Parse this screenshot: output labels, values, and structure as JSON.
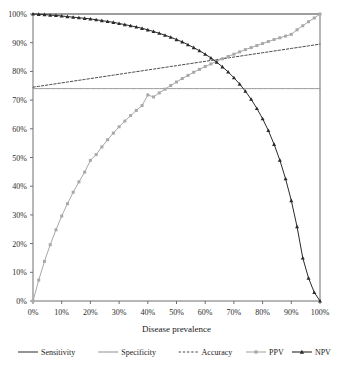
{
  "chart_data": {
    "type": "line",
    "title": "",
    "xlabel": "Disease prevalence",
    "ylabel": "",
    "xlim": [
      0,
      100
    ],
    "ylim": [
      0,
      100
    ],
    "grid": false,
    "legend_position": "bottom",
    "x_ticks": [
      "0%",
      "10%",
      "20%",
      "30%",
      "40%",
      "50%",
      "60%",
      "70%",
      "80%",
      "90%",
      "100%"
    ],
    "x_tick_values": [
      0,
      10,
      20,
      30,
      40,
      50,
      60,
      70,
      80,
      90,
      100
    ],
    "y_ticks": [
      "0%",
      "10%",
      "20%",
      "30%",
      "40%",
      "50%",
      "60%",
      "70%",
      "80%",
      "90%",
      "100%"
    ],
    "y_tick_values": [
      0,
      10,
      20,
      30,
      40,
      50,
      60,
      70,
      80,
      90,
      100
    ],
    "x": [
      0,
      2,
      4,
      6,
      8,
      10,
      12,
      14,
      16,
      18,
      20,
      22,
      24,
      26,
      28,
      30,
      32,
      34,
      36,
      38,
      40,
      42,
      44,
      46,
      48,
      50,
      52,
      54,
      56,
      58,
      60,
      62,
      64,
      66,
      68,
      70,
      72,
      74,
      76,
      78,
      80,
      82,
      84,
      86,
      88,
      90,
      92,
      94,
      96,
      98,
      100
    ],
    "series": [
      {
        "name": "Sensitivity",
        "color": "#3d3d3d",
        "style": "solid",
        "marker": "none",
        "width": 1.1,
        "values": [
          100,
          100,
          100,
          100,
          100,
          100,
          100,
          100,
          100,
          100,
          100,
          100,
          100,
          100,
          100,
          100,
          100,
          100,
          100,
          100,
          100,
          100,
          100,
          100,
          100,
          100,
          100,
          100,
          100,
          100,
          100,
          100,
          100,
          100,
          100,
          100,
          100,
          100,
          100,
          100,
          100,
          100,
          100,
          100,
          100,
          100,
          100,
          100,
          100,
          100,
          100
        ]
      },
      {
        "name": "Specificity",
        "color": "#9a9a9a",
        "style": "solid",
        "marker": "none",
        "width": 1.0,
        "values": [
          74,
          74,
          74,
          74,
          74,
          74,
          74,
          74,
          74,
          74,
          74,
          74,
          74,
          74,
          74,
          74,
          74,
          74,
          74,
          74,
          74,
          74,
          74,
          74,
          74,
          74,
          74,
          74,
          74,
          74,
          74,
          74,
          74,
          74,
          74,
          74,
          74,
          74,
          74,
          74,
          74,
          74,
          74,
          74,
          74,
          74,
          74,
          74,
          74,
          74,
          74
        ]
      },
      {
        "name": "Accuracy",
        "color": "#4a4a4a",
        "style": "dashed",
        "marker": "none",
        "width": 1.0,
        "values": [
          74.5,
          74.8,
          75.1,
          75.4,
          75.7,
          76.0,
          76.3,
          76.6,
          76.9,
          77.2,
          77.5,
          77.8,
          78.1,
          78.4,
          78.7,
          79.0,
          79.3,
          79.6,
          79.9,
          80.2,
          80.5,
          80.8,
          81.1,
          81.4,
          81.7,
          82.0,
          82.3,
          82.6,
          82.9,
          83.2,
          83.5,
          83.8,
          84.1,
          84.4,
          84.7,
          85.0,
          85.3,
          85.6,
          85.9,
          86.2,
          86.5,
          86.8,
          87.1,
          87.4,
          87.7,
          88.0,
          88.3,
          88.6,
          88.9,
          89.2,
          89.5
        ]
      },
      {
        "name": "PPV",
        "color": "#a8a8a8",
        "style": "solid",
        "marker": "square",
        "width": 1.0,
        "values": [
          0,
          7.3,
          13.8,
          19.6,
          24.8,
          29.6,
          33.9,
          37.9,
          41.5,
          44.9,
          49.0,
          51.0,
          53.7,
          56.2,
          58.5,
          60.7,
          62.7,
          64.6,
          66.4,
          68.1,
          71.8,
          71.1,
          72.5,
          73.8,
          75.1,
          76.3,
          77.5,
          78.6,
          79.7,
          80.7,
          81.7,
          82.6,
          83.5,
          84.4,
          85.2,
          86.0,
          86.8,
          87.6,
          88.3,
          89.0,
          89.7,
          90.4,
          91.1,
          91.7,
          92.3,
          92.9,
          94.5,
          95.9,
          97.3,
          98.6,
          100
        ]
      },
      {
        "name": "NPV",
        "color": "#2a2a2a",
        "style": "solid",
        "marker": "triangle",
        "width": 1.0,
        "values": [
          100,
          99.9,
          99.8,
          99.6,
          99.5,
          99.3,
          99.1,
          98.9,
          98.7,
          98.5,
          98.3,
          98.0,
          97.7,
          97.4,
          97.1,
          96.7,
          96.3,
          95.9,
          95.5,
          95.0,
          94.5,
          93.9,
          93.3,
          92.6,
          91.9,
          91.1,
          90.3,
          89.3,
          88.3,
          87.2,
          86.0,
          84.7,
          83.2,
          81.6,
          79.8,
          77.8,
          75.6,
          73.1,
          70.3,
          67.1,
          63.5,
          59.4,
          54.6,
          49.1,
          42.6,
          35.0,
          25.9,
          15.0,
          8.0,
          3.0,
          0
        ]
      }
    ],
    "legend": [
      {
        "label": "Sensitivity",
        "color": "#3d3d3d",
        "style": "solid",
        "marker": "none"
      },
      {
        "label": "Specificity",
        "color": "#9a9a9a",
        "style": "solid",
        "marker": "none"
      },
      {
        "label": "Accuracy",
        "color": "#4a4a4a",
        "style": "dashed",
        "marker": "none"
      },
      {
        "label": "PPV",
        "color": "#a8a8a8",
        "style": "solid",
        "marker": "square"
      },
      {
        "label": "NPV",
        "color": "#2a2a2a",
        "style": "solid",
        "marker": "triangle"
      }
    ]
  },
  "layout": {
    "plot_left": 33,
    "plot_right": 320,
    "plot_top": 14,
    "plot_bottom": 301,
    "axis_color": "#6e6e6e"
  }
}
